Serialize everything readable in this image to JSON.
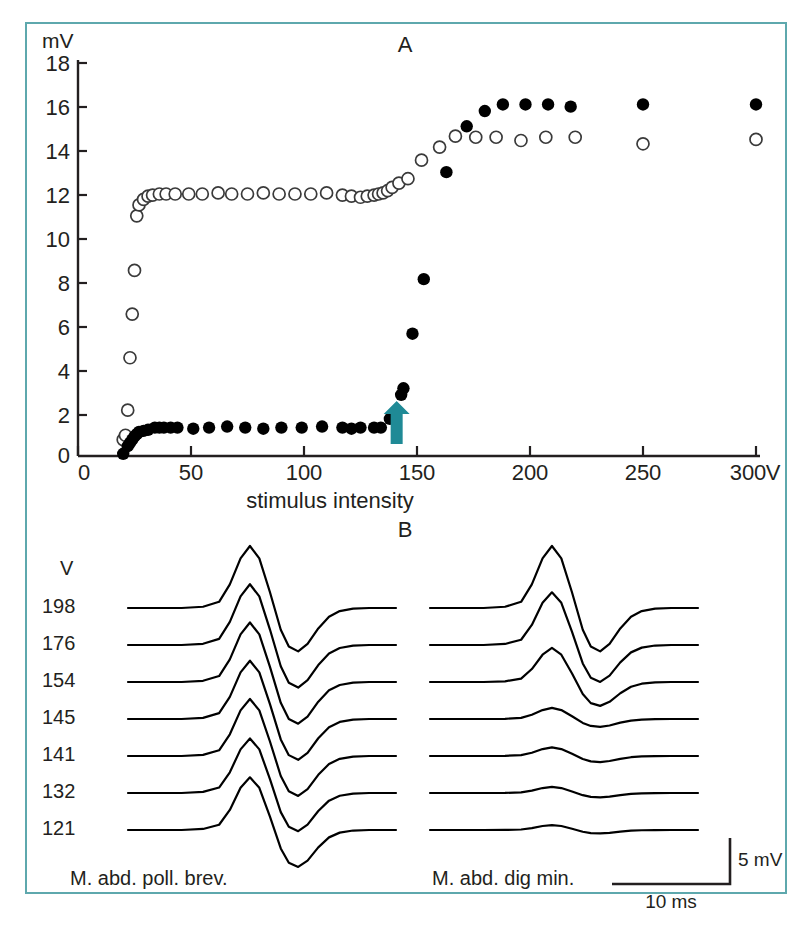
{
  "figure": {
    "border_color": "#5ea8ad",
    "background": "#ffffff",
    "marker_color": "#000000",
    "arrow_color": "#1f8a96"
  },
  "panels": {
    "a_label": "A",
    "b_label": "B"
  },
  "chart_data": [
    {
      "type": "scatter",
      "title": "A",
      "xlabel": "stimulus intensity",
      "ylabel": "mV",
      "x_unit": "V",
      "y_unit": "mV",
      "xlim": [
        0,
        310
      ],
      "ylim": [
        0,
        18
      ],
      "xticks": [
        0,
        50,
        100,
        150,
        200,
        250,
        300
      ],
      "xticklabels": [
        "0",
        "50",
        "100",
        "150",
        "200",
        "250",
        "300"
      ],
      "yticks": [
        0,
        2,
        4,
        6,
        8,
        10,
        12,
        14,
        16,
        18
      ],
      "yticklabels": [
        "0",
        "2",
        "4",
        "6",
        "8",
        "10",
        "12",
        "14",
        "16",
        "18"
      ],
      "grid": false,
      "legend": "none",
      "annotations": [
        {
          "type": "arrow",
          "x": 141,
          "y": 0.55,
          "color": "#1f8a96",
          "direction": "up"
        }
      ],
      "series": [
        {
          "name": "M. abd. poll. brev.",
          "marker": "open-circle",
          "points": [
            [
              20,
              0.75
            ],
            [
              21,
              0.95
            ],
            [
              22,
              2.1
            ],
            [
              23,
              4.5
            ],
            [
              24,
              6.5
            ],
            [
              25,
              8.5
            ],
            [
              26,
              11.0
            ],
            [
              27,
              11.5
            ],
            [
              29,
              11.75
            ],
            [
              31,
              11.9
            ],
            [
              33,
              11.95
            ],
            [
              36,
              12.0
            ],
            [
              39,
              12.0
            ],
            [
              43,
              12.0
            ],
            [
              49,
              12.0
            ],
            [
              55,
              12.0
            ],
            [
              62,
              12.05
            ],
            [
              68,
              12.0
            ],
            [
              75,
              12.0
            ],
            [
              82,
              12.05
            ],
            [
              89,
              12.0
            ],
            [
              96,
              12.0
            ],
            [
              103,
              12.0
            ],
            [
              110,
              12.05
            ],
            [
              117,
              11.95
            ],
            [
              121,
              11.9
            ],
            [
              125,
              11.85
            ],
            [
              128,
              11.9
            ],
            [
              131,
              11.95
            ],
            [
              133,
              12.0
            ],
            [
              135,
              12.05
            ],
            [
              137,
              12.15
            ],
            [
              139,
              12.3
            ],
            [
              142,
              12.5
            ],
            [
              146,
              12.7
            ],
            [
              152,
              13.55
            ],
            [
              160,
              14.15
            ],
            [
              167,
              14.65
            ],
            [
              176,
              14.6
            ],
            [
              185,
              14.6
            ],
            [
              196,
              14.45
            ],
            [
              207,
              14.6
            ],
            [
              220,
              14.6
            ],
            [
              250,
              14.3
            ],
            [
              300,
              14.5
            ]
          ]
        },
        {
          "name": "M. abd. dig min.",
          "marker": "filled-circle",
          "points": [
            [
              20,
              0.1
            ],
            [
              22,
              0.45
            ],
            [
              23,
              0.6
            ],
            [
              24,
              0.75
            ],
            [
              25,
              0.9
            ],
            [
              26,
              1.0
            ],
            [
              27,
              1.1
            ],
            [
              29,
              1.15
            ],
            [
              31,
              1.2
            ],
            [
              34,
              1.3
            ],
            [
              36,
              1.3
            ],
            [
              38,
              1.3
            ],
            [
              41,
              1.3
            ],
            [
              44,
              1.3
            ],
            [
              51,
              1.25
            ],
            [
              58,
              1.3
            ],
            [
              66,
              1.35
            ],
            [
              74,
              1.3
            ],
            [
              82,
              1.25
            ],
            [
              90,
              1.3
            ],
            [
              99,
              1.3
            ],
            [
              108,
              1.35
            ],
            [
              117,
              1.3
            ],
            [
              121,
              1.25
            ],
            [
              125,
              1.3
            ],
            [
              131,
              1.3
            ],
            [
              134,
              1.3
            ],
            [
              138,
              1.7
            ],
            [
              143,
              2.8
            ],
            [
              144,
              3.1
            ],
            [
              148,
              5.6
            ],
            [
              153,
              8.1
            ],
            [
              163,
              13.0
            ],
            [
              172,
              15.1
            ],
            [
              180,
              15.8
            ],
            [
              188,
              16.1
            ],
            [
              198,
              16.1
            ],
            [
              208,
              16.1
            ],
            [
              218,
              16.0
            ],
            [
              250,
              16.1
            ],
            [
              300,
              16.1
            ]
          ]
        }
      ]
    },
    {
      "type": "line",
      "title": "B",
      "xlabel": "",
      "ylabel": "",
      "voltage_unit": "V",
      "voltages": [
        "198",
        "176",
        "154",
        "145",
        "141",
        "132",
        "121"
      ],
      "traces": [
        {
          "muscle": "M. abd. poll. brev.",
          "amplitudes": [
            1.0,
            0.98,
            0.96,
            0.94,
            0.92,
            0.88,
            0.85
          ]
        },
        {
          "muscle": "M. abd. dig min.",
          "amplitudes": [
            1.0,
            0.85,
            0.55,
            0.18,
            0.14,
            0.1,
            0.08
          ]
        }
      ],
      "scale_bar": {
        "vertical": "5 mV",
        "horizontal": "10 ms"
      }
    }
  ],
  "panel_a": {
    "y_axis_unit": "mV",
    "x_axis_title": "stimulus intensity",
    "x_axis_unit": "V",
    "yticks": [
      "18",
      "16",
      "14",
      "12",
      "10",
      "8",
      "6",
      "4",
      "2",
      "0"
    ],
    "xticks": [
      "0",
      "50",
      "100",
      "150",
      "200",
      "250",
      "300"
    ]
  },
  "panel_b": {
    "voltage_header": "V",
    "voltages": [
      "198",
      "176",
      "154",
      "145",
      "141",
      "132",
      "121"
    ],
    "left_muscle": "M. abd. poll. brev.",
    "right_muscle": "M. abd. dig min.",
    "scale_vertical": "5 mV",
    "scale_horizontal": "10 ms"
  }
}
